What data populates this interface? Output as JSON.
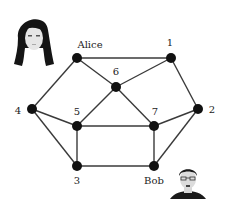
{
  "diagram": {
    "type": "graph",
    "nodes": [
      {
        "id": "alice",
        "label": "Alice",
        "x": 77,
        "y": 58,
        "lx": 90,
        "ly": 48,
        "anchor": "middle"
      },
      {
        "id": "n1",
        "label": "1",
        "x": 171,
        "y": 58,
        "lx": 170,
        "ly": 46,
        "anchor": "middle"
      },
      {
        "id": "n6",
        "label": "6",
        "x": 116,
        "y": 87,
        "lx": 116,
        "ly": 75,
        "anchor": "middle"
      },
      {
        "id": "n4",
        "label": "4",
        "x": 32,
        "y": 109,
        "lx": 18,
        "ly": 114,
        "anchor": "middle"
      },
      {
        "id": "n2",
        "label": "2",
        "x": 198,
        "y": 109,
        "lx": 212,
        "ly": 113,
        "anchor": "middle"
      },
      {
        "id": "n5",
        "label": "5",
        "x": 77,
        "y": 126,
        "lx": 77,
        "ly": 115,
        "anchor": "middle"
      },
      {
        "id": "n7",
        "label": "7",
        "x": 154,
        "y": 126,
        "lx": 155,
        "ly": 115,
        "anchor": "middle"
      },
      {
        "id": "n3",
        "label": "3",
        "x": 77,
        "y": 166,
        "lx": 77,
        "ly": 184,
        "anchor": "middle"
      },
      {
        "id": "bob",
        "label": "Bob",
        "x": 154,
        "y": 166,
        "lx": 154,
        "ly": 184,
        "anchor": "middle"
      }
    ],
    "edges": [
      [
        "alice",
        "n1"
      ],
      [
        "alice",
        "n6"
      ],
      [
        "alice",
        "n4"
      ],
      [
        "n1",
        "n6"
      ],
      [
        "n1",
        "n2"
      ],
      [
        "n6",
        "n5"
      ],
      [
        "n6",
        "n7"
      ],
      [
        "n4",
        "n5"
      ],
      [
        "n4",
        "n3"
      ],
      [
        "n5",
        "n7"
      ],
      [
        "n5",
        "n3"
      ],
      [
        "n3",
        "bob"
      ],
      [
        "n7",
        "bob"
      ],
      [
        "n7",
        "n2"
      ],
      [
        "n2",
        "bob"
      ]
    ],
    "portraits": [
      {
        "name": "alice-portrait",
        "x": 10,
        "y": 8,
        "gender": "female"
      },
      {
        "name": "bob-portrait",
        "x": 168,
        "y": 163,
        "gender": "male"
      }
    ],
    "colors": {
      "edge": "#3a3a3a",
      "node": "#111111",
      "label": "#222222"
    }
  }
}
